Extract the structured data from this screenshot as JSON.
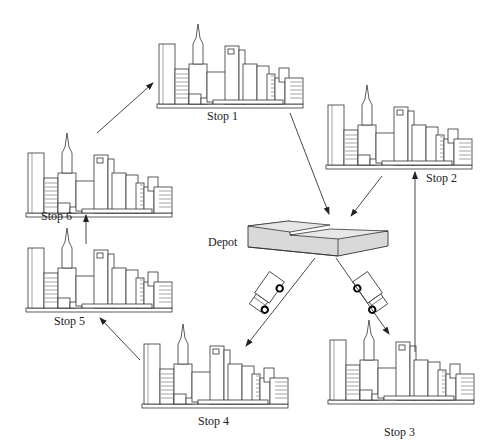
{
  "diagram": {
    "type": "vehicle-routing",
    "depot": {
      "label": "Depot"
    },
    "stops": [
      {
        "id": 1,
        "label": "Stop 1"
      },
      {
        "id": 2,
        "label": "Stop 2"
      },
      {
        "id": 3,
        "label": "Stop 3"
      },
      {
        "id": 4,
        "label": "Stop 4"
      },
      {
        "id": 5,
        "label": "Stop 5"
      },
      {
        "id": 6,
        "label": "Stop 6"
      }
    ],
    "routes": [
      {
        "name": "route-a",
        "sequence": [
          "Depot",
          "Stop 3",
          "Stop 2",
          "Depot"
        ]
      },
      {
        "name": "route-b",
        "sequence": [
          "Depot",
          "Stop 4",
          "Stop 5",
          "Stop 6",
          "Stop 1",
          "Depot"
        ]
      }
    ],
    "colors": {
      "line": "#333333",
      "depot_fill": "#d9d9d9",
      "background": "#ffffff"
    }
  }
}
